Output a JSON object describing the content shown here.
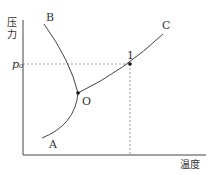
{
  "diagram": {
    "type": "phase-diagram",
    "y_axis_label": [
      "压",
      "力"
    ],
    "x_axis_label": "温度",
    "pressure_marker": "p₀",
    "curves": [
      {
        "name": "B",
        "label": "B"
      },
      {
        "name": "C",
        "label": "C"
      },
      {
        "name": "A",
        "label": "A"
      }
    ],
    "points": [
      {
        "name": "triple-point",
        "label": "O"
      },
      {
        "name": "point-1",
        "label": "1"
      }
    ],
    "colors": {
      "line": "#444444",
      "dash": "#888888"
    }
  }
}
